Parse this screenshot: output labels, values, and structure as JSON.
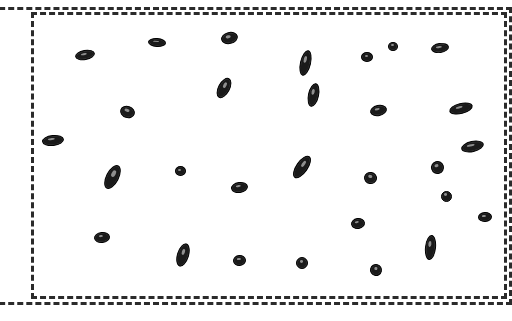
{
  "scene": {
    "title": "Grain Detection Region Overlay",
    "canvas_width": 512,
    "canvas_height": 321,
    "background_color": "#ffffff",
    "annotation_color": "#2b2b2b",
    "object_fill_color": "#1a1a1a",
    "object_outline_color": "#000000",
    "object_count_label": "29"
  },
  "regions": [
    {
      "name": "outer-region-of-interest",
      "style": "dashed",
      "color": "#2b2b2b",
      "border_width": 3,
      "x": -28,
      "y": 7,
      "width": 540,
      "height": 298,
      "clipped": "left"
    },
    {
      "name": "inner-region-of-interest",
      "style": "dashed",
      "color": "#2b2b2b",
      "border_width": 3,
      "x": 31,
      "y": 12,
      "width": 476,
      "height": 287,
      "clipped": "none"
    }
  ],
  "objects": [
    {
      "id": "grain-01",
      "cx": 53,
      "cy": 140,
      "w": 22,
      "h": 11,
      "angle": -6
    },
    {
      "id": "grain-02",
      "cx": 85,
      "cy": 55,
      "w": 20,
      "h": 10,
      "angle": -10
    },
    {
      "id": "grain-03",
      "cx": 127,
      "cy": 112,
      "w": 15,
      "h": 12,
      "angle": 18
    },
    {
      "id": "grain-04",
      "cx": 157,
      "cy": 42,
      "w": 18,
      "h": 9,
      "angle": 4
    },
    {
      "id": "grain-05",
      "cx": 229,
      "cy": 38,
      "w": 17,
      "h": 12,
      "angle": -14
    },
    {
      "id": "grain-06",
      "cx": 224,
      "cy": 88,
      "w": 12,
      "h": 22,
      "angle": 28
    },
    {
      "id": "grain-07",
      "cx": 305,
      "cy": 63,
      "w": 11,
      "h": 26,
      "angle": 13
    },
    {
      "id": "grain-08",
      "cx": 367,
      "cy": 57,
      "w": 12,
      "h": 10,
      "angle": 0
    },
    {
      "id": "grain-09",
      "cx": 440,
      "cy": 48,
      "w": 18,
      "h": 10,
      "angle": -8
    },
    {
      "id": "grain-10",
      "cx": 378,
      "cy": 110,
      "w": 17,
      "h": 11,
      "angle": -12
    },
    {
      "id": "grain-11",
      "cx": 461,
      "cy": 108,
      "w": 24,
      "h": 11,
      "angle": -14
    },
    {
      "id": "grain-12",
      "cx": 112,
      "cy": 177,
      "w": 13,
      "h": 26,
      "angle": 27
    },
    {
      "id": "grain-13",
      "cx": 180,
      "cy": 171,
      "w": 11,
      "h": 10,
      "angle": 0
    },
    {
      "id": "grain-14",
      "cx": 239,
      "cy": 187,
      "w": 17,
      "h": 11,
      "angle": -8
    },
    {
      "id": "grain-15",
      "cx": 102,
      "cy": 237,
      "w": 16,
      "h": 11,
      "angle": -6
    },
    {
      "id": "grain-16",
      "cx": 183,
      "cy": 255,
      "w": 12,
      "h": 24,
      "angle": 17
    },
    {
      "id": "grain-17",
      "cx": 239,
      "cy": 260,
      "w": 13,
      "h": 11,
      "angle": -4
    },
    {
      "id": "grain-18",
      "cx": 302,
      "cy": 167,
      "w": 12,
      "h": 26,
      "angle": 35
    },
    {
      "id": "grain-19",
      "cx": 370,
      "cy": 178,
      "w": 13,
      "h": 12,
      "angle": 10
    },
    {
      "id": "grain-20",
      "cx": 437,
      "cy": 167,
      "w": 13,
      "h": 13,
      "angle": -16
    },
    {
      "id": "grain-21",
      "cx": 358,
      "cy": 223,
      "w": 14,
      "h": 11,
      "angle": -9
    },
    {
      "id": "grain-22",
      "cx": 485,
      "cy": 217,
      "w": 14,
      "h": 10,
      "angle": -4
    },
    {
      "id": "grain-23",
      "cx": 430,
      "cy": 247,
      "w": 11,
      "h": 25,
      "angle": 6
    },
    {
      "id": "grain-24",
      "cx": 302,
      "cy": 263,
      "w": 12,
      "h": 12,
      "angle": 0
    },
    {
      "id": "grain-25",
      "cx": 376,
      "cy": 270,
      "w": 12,
      "h": 12,
      "angle": 14
    },
    {
      "id": "grain-26",
      "cx": 393,
      "cy": 46,
      "w": 10,
      "h": 9,
      "angle": 0
    },
    {
      "id": "grain-27",
      "cx": 472,
      "cy": 146,
      "w": 23,
      "h": 11,
      "angle": -12
    },
    {
      "id": "grain-28",
      "cx": 446,
      "cy": 196,
      "w": 11,
      "h": 11,
      "angle": 0
    },
    {
      "id": "grain-29",
      "cx": 313,
      "cy": 95,
      "w": 11,
      "h": 24,
      "angle": 12
    }
  ]
}
